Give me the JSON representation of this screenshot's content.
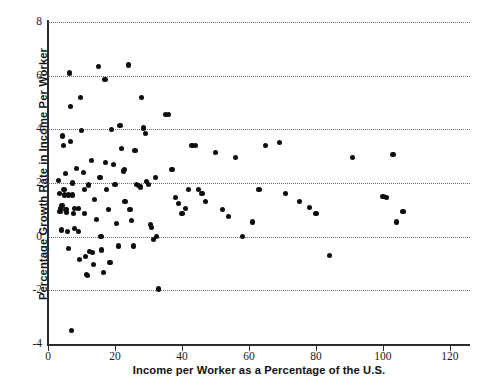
{
  "chart_data": {
    "type": "scatter",
    "title": "",
    "xlabel": "Income per Worker as a Percentage of the U.S.",
    "ylabel": "Percentage Growth Rate in Income Per Worker",
    "xlim": [
      0,
      126
    ],
    "ylim": [
      -4,
      8
    ],
    "xticks": [
      0,
      20,
      40,
      60,
      80,
      100,
      120
    ],
    "xtick_labels": [
      "0",
      "20",
      "40",
      "60",
      "80",
      "100",
      "120"
    ],
    "yticks": [
      -4,
      -2,
      0,
      2,
      4,
      6,
      8
    ],
    "ytick_labels": [
      "-4",
      "-2",
      "0",
      "2",
      "4",
      "6",
      "8"
    ],
    "gridlines_y": [
      -2,
      0,
      2,
      4,
      6,
      8
    ],
    "grid": "horizontal dotted",
    "legend": "none",
    "marker": "filled circle",
    "marker_color": "#0d0d0d",
    "points": [
      [
        3.2,
        2.1
      ],
      [
        3.4,
        1.6
      ],
      [
        3.6,
        0.95
      ],
      [
        3.8,
        1.05
      ],
      [
        4.0,
        0.25
      ],
      [
        4.2,
        1.15
      ],
      [
        4.4,
        3.75
      ],
      [
        4.6,
        3.4
      ],
      [
        4.8,
        1.75
      ],
      [
        5.0,
        1.55
      ],
      [
        5.2,
        2.35
      ],
      [
        5.4,
        1.0
      ],
      [
        5.6,
        0.9
      ],
      [
        5.8,
        0.2
      ],
      [
        6.0,
        -0.45
      ],
      [
        6.2,
        1.55
      ],
      [
        6.4,
        6.1
      ],
      [
        6.6,
        4.85
      ],
      [
        6.8,
        3.55
      ],
      [
        7.0,
        -3.5
      ],
      [
        7.2,
        2.0
      ],
      [
        7.4,
        1.55
      ],
      [
        7.6,
        0.85
      ],
      [
        7.8,
        0.3
      ],
      [
        8.0,
        1.05
      ],
      [
        8.5,
        2.55
      ],
      [
        9.0,
        1.05
      ],
      [
        9.2,
        0.2
      ],
      [
        9.5,
        -0.85
      ],
      [
        9.8,
        5.2
      ],
      [
        10.0,
        3.95
      ],
      [
        10.5,
        2.4
      ],
      [
        10.8,
        1.75
      ],
      [
        11.0,
        0.85
      ],
      [
        11.2,
        -0.75
      ],
      [
        11.5,
        -1.4
      ],
      [
        11.8,
        -1.45
      ],
      [
        12.0,
        1.9
      ],
      [
        12.2,
        1.95
      ],
      [
        12.5,
        -0.55
      ],
      [
        13.0,
        2.85
      ],
      [
        13.2,
        -0.6
      ],
      [
        13.5,
        -1.05
      ],
      [
        14.0,
        1.4
      ],
      [
        14.5,
        0.65
      ],
      [
        15.0,
        6.35
      ],
      [
        15.5,
        2.2
      ],
      [
        15.8,
        0.0
      ],
      [
        16.0,
        -0.5
      ],
      [
        16.5,
        -1.35
      ],
      [
        17.0,
        5.85
      ],
      [
        17.2,
        2.75
      ],
      [
        17.5,
        1.75
      ],
      [
        18.0,
        1.0
      ],
      [
        18.5,
        -0.95
      ],
      [
        19.0,
        4.0
      ],
      [
        19.5,
        2.7
      ],
      [
        20.0,
        1.95
      ],
      [
        20.5,
        0.5
      ],
      [
        21.0,
        -0.35
      ],
      [
        21.5,
        4.15
      ],
      [
        22.0,
        3.3
      ],
      [
        22.5,
        2.45
      ],
      [
        22.8,
        2.5
      ],
      [
        23.0,
        1.3
      ],
      [
        24.0,
        6.4
      ],
      [
        24.5,
        1.0
      ],
      [
        25.0,
        0.6
      ],
      [
        25.5,
        -0.35
      ],
      [
        26.0,
        3.2
      ],
      [
        26.5,
        1.95
      ],
      [
        27.0,
        1.9
      ],
      [
        27.5,
        1.85
      ],
      [
        28.0,
        5.2
      ],
      [
        28.5,
        4.05
      ],
      [
        29.0,
        3.85
      ],
      [
        29.5,
        2.05
      ],
      [
        30.0,
        1.95
      ],
      [
        30.5,
        0.45
      ],
      [
        31.0,
        0.35
      ],
      [
        31.5,
        -0.1
      ],
      [
        32.0,
        2.2
      ],
      [
        32.5,
        0.0
      ],
      [
        33.0,
        -1.95
      ],
      [
        35.0,
        4.55
      ],
      [
        36.0,
        4.55
      ],
      [
        37.0,
        2.5
      ],
      [
        38.0,
        1.45
      ],
      [
        39.0,
        1.25
      ],
      [
        40.0,
        0.85
      ],
      [
        41.0,
        1.05
      ],
      [
        42.0,
        1.75
      ],
      [
        43.0,
        3.4
      ],
      [
        44.0,
        3.4
      ],
      [
        45.0,
        1.75
      ],
      [
        46.0,
        1.6
      ],
      [
        47.0,
        1.3
      ],
      [
        50.0,
        3.15
      ],
      [
        52.0,
        1.0
      ],
      [
        54.0,
        0.75
      ],
      [
        56.0,
        2.95
      ],
      [
        58.0,
        0.0
      ],
      [
        61.0,
        0.55
      ],
      [
        63.0,
        1.75
      ],
      [
        65.0,
        3.4
      ],
      [
        69.0,
        3.5
      ],
      [
        71.0,
        1.6
      ],
      [
        75.0,
        1.3
      ],
      [
        78.0,
        1.1
      ],
      [
        80.0,
        0.85
      ],
      [
        84.0,
        -0.7
      ],
      [
        91.0,
        2.95
      ],
      [
        100.0,
        1.5
      ],
      [
        101.0,
        1.45
      ],
      [
        103.0,
        3.05
      ],
      [
        104.0,
        0.55
      ],
      [
        106.0,
        0.95
      ]
    ]
  }
}
